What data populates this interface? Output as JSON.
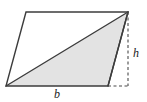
{
  "figure": {
    "name": "parallelogram-with-height-diagram",
    "type": "geometry-diagram",
    "background_color": "#ffffff",
    "shape": {
      "name": "parallelogram",
      "outline_color": "#3c3c3c",
      "outline_width": 1.4,
      "vertices": {
        "top_left": [
          26,
          12
        ],
        "top_right": [
          128,
          12
        ],
        "bottom_right": [
          108,
          86
        ],
        "bottom_left": [
          6,
          86
        ]
      },
      "points_attr": "26,12 128,12 108,86 6,86"
    },
    "shaded_triangle": {
      "name": "shaded-triangle",
      "fill_color": "#e3e3e3",
      "outline_color": "#3c3c3c",
      "outline_width": 1.4,
      "vertices": {
        "bottom_left": [
          6,
          86
        ],
        "top_right": [
          128,
          12
        ],
        "bottom_right": [
          108,
          86
        ]
      },
      "points_attr": "6,86 128,12 108,86"
    },
    "diagonal": {
      "name": "diagonal-line",
      "from": [
        6,
        86
      ],
      "to": [
        128,
        12
      ],
      "color": "#3c3c3c"
    },
    "height_line": {
      "name": "height-dashed-line",
      "from": [
        128,
        12
      ],
      "to": [
        128,
        86
      ],
      "color": "#4a4a4a",
      "dash": "3,2.5",
      "width": 1.1,
      "x1": 128,
      "y1": 12,
      "x2": 128,
      "y2": 86
    },
    "base_extension_line": {
      "name": "base-extension-dashed-line",
      "from": [
        108,
        86
      ],
      "to": [
        128,
        86
      ],
      "color": "#4a4a4a",
      "dash": "3,2.5",
      "width": 1.1,
      "x1": 108,
      "y1": 86,
      "x2": 128,
      "y2": 86
    },
    "labels": {
      "height": {
        "text": "h",
        "x": 136,
        "y": 57,
        "color": "#1a1a1a",
        "style": "italic"
      },
      "base": {
        "text": "b",
        "x": 57,
        "y": 98,
        "color": "#1a1a1a",
        "style": "italic"
      }
    }
  }
}
